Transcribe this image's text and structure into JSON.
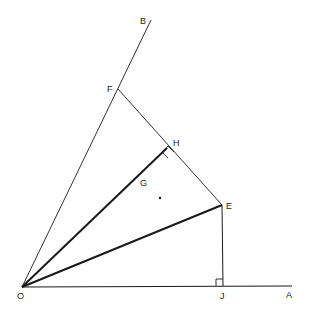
{
  "diagram": {
    "type": "geometry",
    "stroke_color": "#1a1a1a",
    "background": "#ffffff",
    "points": {
      "O": {
        "label": "O",
        "x": 22,
        "y": 287
      },
      "A": {
        "label": "A",
        "x": 292,
        "y": 286
      },
      "B": {
        "label": "B",
        "x": 151,
        "y": 20
      },
      "F": {
        "label": "F",
        "x": 118,
        "y": 89
      },
      "H": {
        "label": "H",
        "x": 167,
        "y": 148
      },
      "E": {
        "label": "E",
        "x": 222,
        "y": 205
      },
      "J": {
        "label": "J",
        "x": 223,
        "y": 286
      },
      "G": {
        "label": "G"
      }
    },
    "segments": [
      {
        "from": "O",
        "to": "A",
        "weight": "thin"
      },
      {
        "from": "O",
        "to": "B",
        "weight": "thin"
      },
      {
        "from": "F",
        "to": "E",
        "weight": "thin"
      },
      {
        "from": "E",
        "to": "J",
        "weight": "thin"
      },
      {
        "from": "O",
        "to": "H",
        "weight": "bold"
      },
      {
        "from": "O",
        "to": "E",
        "weight": "bold"
      }
    ],
    "right_angles": [
      "H",
      "J"
    ],
    "labels": {
      "O": "O",
      "A": "A",
      "B": "B",
      "F": "F",
      "H": "H",
      "E": "E",
      "J": "J",
      "G": "G"
    }
  }
}
